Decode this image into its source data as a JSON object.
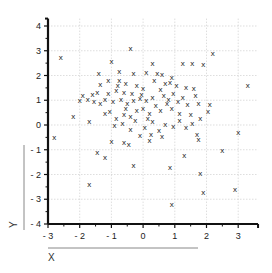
{
  "chart_data": {
    "type": "scatter",
    "title": "",
    "xlabel": "X",
    "ylabel": "Y",
    "xlim": [
      -3,
      3.5
    ],
    "ylim": [
      -4,
      4.3
    ],
    "xticks": [
      -3,
      -2,
      -1,
      0,
      1,
      2,
      3
    ],
    "yticks": [
      -4,
      -3,
      -2,
      -1,
      0,
      1,
      2,
      3,
      4
    ],
    "grid": true,
    "marker": "x",
    "color": "#222222",
    "points": [
      [
        -2.6,
        2.75
      ],
      [
        -0.4,
        3.1
      ],
      [
        2.2,
        2.9
      ],
      [
        3.3,
        1.6
      ],
      [
        -2.8,
        -0.5
      ],
      [
        -1.7,
        -2.4
      ],
      [
        -1.45,
        -1.1
      ],
      [
        -1.2,
        -1.3
      ],
      [
        -1.0,
        -0.65
      ],
      [
        -0.6,
        -0.7
      ],
      [
        -0.45,
        -0.75
      ],
      [
        0.9,
        -3.2
      ],
      [
        1.9,
        -2.7
      ],
      [
        2.9,
        -2.6
      ],
      [
        1.8,
        -1.95
      ],
      [
        0.85,
        -1.7
      ],
      [
        -0.3,
        -1.6
      ],
      [
        2.5,
        -1.0
      ],
      [
        1.3,
        -1.2
      ],
      [
        3.0,
        -0.3
      ],
      [
        1.7,
        -0.35
      ],
      [
        1.75,
        -0.55
      ],
      [
        0.2,
        -0.6
      ],
      [
        -2.2,
        0.35
      ],
      [
        -1.7,
        0.15
      ],
      [
        -1.0,
        2.6
      ],
      [
        -1.4,
        2.1
      ],
      [
        -0.75,
        2.2
      ],
      [
        -0.3,
        2.1
      ],
      [
        -1.35,
        1.65
      ],
      [
        -1.1,
        1.8
      ],
      [
        -0.75,
        1.8
      ],
      [
        -0.55,
        1.7
      ],
      [
        -0.2,
        1.6
      ],
      [
        0.0,
        1.5
      ],
      [
        -1.9,
        1.2
      ],
      [
        -1.45,
        1.35
      ],
      [
        -1.1,
        1.3
      ],
      [
        -0.85,
        1.4
      ],
      [
        -0.6,
        1.35
      ],
      [
        -0.35,
        1.3
      ],
      [
        -2.0,
        1.0
      ],
      [
        -1.75,
        1.05
      ],
      [
        -1.55,
        0.95
      ],
      [
        -1.35,
        0.9
      ],
      [
        -1.2,
        1.05
      ],
      [
        -0.95,
        0.95
      ],
      [
        -0.7,
        1.05
      ],
      [
        -0.5,
        0.9
      ],
      [
        -0.3,
        1.0
      ],
      [
        -0.1,
        1.1
      ],
      [
        0.1,
        1.0
      ],
      [
        0.3,
        1.15
      ],
      [
        -1.2,
        0.5
      ],
      [
        -1.05,
        0.55
      ],
      [
        -0.85,
        0.3
      ],
      [
        -0.6,
        0.45
      ],
      [
        -0.4,
        0.35
      ],
      [
        -0.2,
        0.6
      ],
      [
        0.0,
        0.7
      ],
      [
        0.2,
        0.5
      ],
      [
        0.4,
        0.8
      ],
      [
        0.55,
        0.6
      ],
      [
        0.75,
        0.9
      ],
      [
        0.9,
        0.7
      ],
      [
        -0.9,
        0.0
      ],
      [
        -0.65,
        0.1
      ],
      [
        -0.4,
        -0.15
      ],
      [
        -0.25,
        0.2
      ],
      [
        0.05,
        -0.1
      ],
      [
        0.3,
        0.15
      ],
      [
        0.5,
        -0.2
      ],
      [
        0.7,
        0.05
      ],
      [
        0.95,
        -0.05
      ],
      [
        1.15,
        0.2
      ],
      [
        1.35,
        -0.1
      ],
      [
        1.55,
        0.1
      ],
      [
        0.1,
        2.15
      ],
      [
        0.45,
        2.1
      ],
      [
        0.6,
        2.05
      ],
      [
        0.9,
        1.95
      ],
      [
        1.25,
        2.5
      ],
      [
        1.55,
        2.5
      ],
      [
        1.9,
        2.45
      ],
      [
        0.3,
        2.5
      ],
      [
        0.7,
        1.7
      ],
      [
        0.85,
        1.75
      ],
      [
        1.05,
        1.6
      ],
      [
        1.35,
        1.55
      ],
      [
        1.6,
        1.5
      ],
      [
        0.35,
        1.8
      ],
      [
        0.55,
        1.45
      ],
      [
        0.95,
        1.3
      ],
      [
        1.25,
        1.15
      ],
      [
        1.65,
        1.2
      ],
      [
        0.65,
        1.2
      ],
      [
        0.8,
        1.05
      ],
      [
        1.1,
        0.95
      ],
      [
        1.4,
        0.85
      ],
      [
        1.75,
        0.9
      ],
      [
        2.1,
        0.85
      ],
      [
        1.5,
        0.45
      ],
      [
        1.8,
        0.3
      ],
      [
        2.05,
        0.55
      ],
      [
        1.15,
        0.5
      ],
      [
        0.25,
        -0.35
      ],
      [
        -0.1,
        -0.4
      ],
      [
        0.6,
        -0.45
      ],
      [
        -0.55,
        0.7
      ],
      [
        -0.05,
        1.25
      ],
      [
        0.15,
        0.3
      ],
      [
        -0.8,
        1.6
      ],
      [
        -1.6,
        1.25
      ]
    ]
  }
}
